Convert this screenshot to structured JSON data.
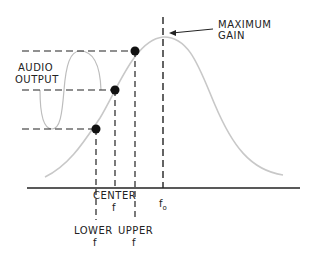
{
  "diagram": {
    "labels": {
      "max_gain_line1": "MAXIMUM",
      "max_gain_line2": "GAIN",
      "audio_line1": "AUDIO",
      "audio_line2": "OUTPUT",
      "center": "CENTER",
      "center_f": "f",
      "lower": "LOWER",
      "lower_f": "f",
      "upper": "UPPER",
      "upper_f": "f",
      "f0": "f",
      "f0_sub": "o"
    },
    "points": [
      {
        "name": "upper",
        "x": 135,
        "y": 51
      },
      {
        "name": "center",
        "x": 115,
        "y": 90
      },
      {
        "name": "lower",
        "x": 96,
        "y": 129
      }
    ],
    "colors": {
      "ink": "#111111",
      "curve": "#c8c8c8",
      "background": "#ffffff"
    }
  }
}
